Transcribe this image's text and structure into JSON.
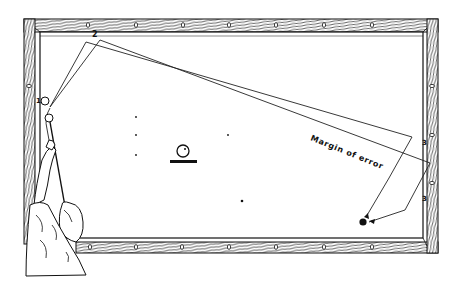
{
  "diagram": {
    "type": "billiards-shot-illustration",
    "caption": "Margin of error",
    "rail_labels": {
      "top": "2",
      "left": "1",
      "right_upper": "3",
      "right_lower": "3"
    },
    "colors": {
      "ink": "#111111",
      "background": "#ffffff",
      "felt": "#ffffff"
    },
    "elements": [
      {
        "name": "table-frame",
        "kind": "wood rail with diamonds"
      },
      {
        "name": "cue-ball",
        "kind": "open circle"
      },
      {
        "name": "second-ball",
        "kind": "open circle"
      },
      {
        "name": "object-ball",
        "kind": "solid circle"
      },
      {
        "name": "shot-path-inner",
        "kind": "line"
      },
      {
        "name": "shot-path-outer",
        "kind": "line"
      },
      {
        "name": "margin-of-error-zone",
        "kind": "wedge"
      },
      {
        "name": "player-figure",
        "kind": "line drawing"
      },
      {
        "name": "spot-marker",
        "kind": "ball on base"
      }
    ]
  }
}
